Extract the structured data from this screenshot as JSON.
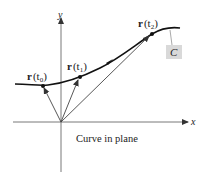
{
  "diagram": {
    "caption": "Curve in plane",
    "axes": {
      "x_label": "x",
      "y_label": "y"
    },
    "curve_label": "C",
    "points": [
      {
        "label_bold": "r",
        "label_rest": "(t",
        "sub": "0",
        "close": ")"
      },
      {
        "label_bold": "r",
        "label_rest": "(t",
        "sub": "1",
        "close": ")"
      },
      {
        "label_bold": "r",
        "label_rest": "(t",
        "sub": "2",
        "close": ")"
      }
    ],
    "colors": {
      "line": "#222222",
      "label_box": "#d9d9d9",
      "leader": "#aaaaaa"
    }
  }
}
